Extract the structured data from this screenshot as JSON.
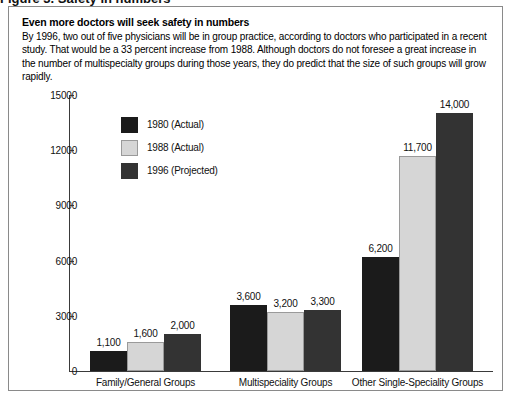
{
  "scan": {
    "top_clipped_text": "Figure 3. Safety in numbers"
  },
  "header": {
    "headline": "Even more doctors will seek safety in numbers",
    "deck": "By 1996, two out of five physicians will be in group practice, according to doctors who participated in a recent study. That would be a 33 percent increase from 1988. Although doctors do not foresee a great increase in the number of multispecialty groups during those years, they do predict that the size of such groups will grow rapidly."
  },
  "legend": {
    "position": "inside-top-left",
    "items": [
      {
        "label": "1980 (Actual)",
        "color": "#1b1b1b"
      },
      {
        "label": "1988 (Actual)",
        "color": "#d6d6d6"
      },
      {
        "label": "1996 (Projected)",
        "color": "#333333"
      }
    ]
  },
  "chart_data": {
    "type": "bar",
    "title": "Even more doctors will seek safety in numbers",
    "xlabel": "",
    "ylabel": "",
    "grid": false,
    "legend_position": "inside-top-left",
    "categories": [
      "Family/General Groups",
      "Multispeciality Groups",
      "Other Single-Speciality Groups"
    ],
    "series": [
      {
        "name": "1980 (Actual)",
        "color": "#1b1b1b",
        "values": [
          1100,
          3600,
          6200
        ],
        "labels": [
          "1,100",
          "3,600",
          "6,200"
        ]
      },
      {
        "name": "1988 (Actual)",
        "color": "#d6d6d6",
        "values": [
          1600,
          3200,
          11700
        ],
        "labels": [
          "1,600",
          "3,200",
          "11,700"
        ]
      },
      {
        "name": "1996 (Projected)",
        "color": "#333333",
        "values": [
          2000,
          3300,
          14000
        ],
        "labels": [
          "2,000",
          "3,300",
          "14,000"
        ]
      }
    ],
    "ylim": [
      0,
      15000
    ],
    "yticks": [
      0,
      3000,
      6000,
      9000,
      12000,
      15000
    ],
    "ytick_labels": [
      "0",
      "3000",
      "6000",
      "9000",
      "12000",
      "15000"
    ]
  }
}
